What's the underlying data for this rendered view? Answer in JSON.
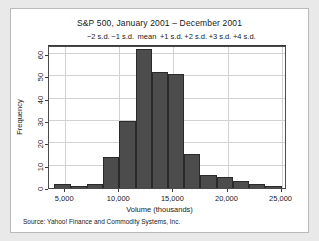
{
  "figure": {
    "source_note": "Source:  Yahoo! Finance and Commodity Systems, Inc.",
    "background": "#e9e9e9",
    "panel_background": "#ffffff",
    "bar_color": "#4c4c4c",
    "grid_color": "#d2d2d2",
    "axis_color": "#3a3a3a"
  },
  "chart_data": {
    "type": "bar",
    "title": "S&P 500, January 2001 – December 2001",
    "xlabel": "Volume (thousands)",
    "ylabel": "Frequency",
    "xlim": [
      3500,
      25500
    ],
    "ylim": [
      0,
      64
    ],
    "grid": true,
    "legend": null,
    "xticks": [
      5000,
      10000,
      15000,
      20000,
      25000
    ],
    "xticklabels": [
      "5,000",
      "10,000",
      "15,000",
      "20,000",
      "25,000"
    ],
    "yticks": [
      0,
      10,
      20,
      30,
      40,
      50,
      60
    ],
    "yticklabels": [
      "0",
      "10",
      "20",
      "30",
      "40",
      "50",
      "60"
    ],
    "bin_width": 1500,
    "bin_edges": [
      4000,
      5500,
      7000,
      8500,
      10000,
      11500,
      13000,
      14500,
      16000,
      17500,
      19000,
      20500,
      22000,
      23500,
      25000
    ],
    "bin_centers": [
      4750,
      6250,
      7750,
      9250,
      10750,
      12250,
      13750,
      15250,
      16750,
      18250,
      19750,
      21250,
      22750,
      24250
    ],
    "values": [
      2,
      1,
      2,
      14,
      30,
      62,
      52,
      51,
      15,
      6,
      5,
      3,
      2,
      1
    ],
    "secondary_axis": {
      "position": "top",
      "label_values": [
        "−2 s.d.",
        "−1 s.d.",
        "mean",
        "+1 s.d.",
        "+2 s.d.",
        "+3 s.d.",
        "+4 s.d."
      ],
      "tick_volumes": [
        8150,
        10400,
        12650,
        14900,
        17150,
        19400,
        21650
      ],
      "mean": 12650,
      "sd": 2250
    }
  }
}
